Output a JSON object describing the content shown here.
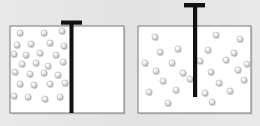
{
  "figure": {
    "background_color": "#e6e6e6",
    "width": 260,
    "height": 126
  },
  "style": {
    "container_fill": "#ffffff",
    "container_border": "#8a8a8a",
    "container_border_width": 1.2,
    "piston_color": "#111111",
    "particle_fill": "#d9d9d9",
    "particle_edge": "#9a9a9a",
    "particle_highlight": "#ffffff",
    "particle_radius": 3.1,
    "shadow_color": "#b8b8b8"
  },
  "panels": [
    {
      "id": "left-panel",
      "name": "compressed-gas-cylinder",
      "label": "",
      "container": {
        "x": 10,
        "y": 26,
        "width": 114,
        "height": 87
      },
      "piston": {
        "name": "piston-compressed",
        "state": "lowered",
        "stem": {
          "x": 69.5,
          "y": 24,
          "width": 4.0,
          "height": 89
        },
        "cap": {
          "x": 61,
          "y": 20.5,
          "width": 21,
          "height": 4.2
        },
        "handle_top_y": 20.5,
        "stem_bottom_y": 113
      },
      "gas_region": {
        "x": 11,
        "y": 27,
        "width": 58,
        "height": 85
      },
      "particle_count": 27,
      "particles": [
        [
          20,
          33
        ],
        [
          44,
          33
        ],
        [
          62,
          31
        ],
        [
          17,
          45
        ],
        [
          31,
          44
        ],
        [
          50,
          43
        ],
        [
          64,
          46
        ],
        [
          14,
          54
        ],
        [
          26,
          55
        ],
        [
          40,
          53
        ],
        [
          56,
          55
        ],
        [
          22,
          64
        ],
        [
          36,
          63
        ],
        [
          48,
          66
        ],
        [
          63,
          62
        ],
        [
          15,
          72
        ],
        [
          30,
          74
        ],
        [
          44,
          73
        ],
        [
          58,
          75
        ],
        [
          20,
          84
        ],
        [
          34,
          85
        ],
        [
          50,
          84
        ],
        [
          65,
          83
        ],
        [
          14,
          96
        ],
        [
          28,
          97
        ],
        [
          45,
          99
        ],
        [
          60,
          97
        ]
      ]
    },
    {
      "id": "right-panel",
      "name": "expanded-gas-cylinder",
      "label": "",
      "container": {
        "x": 138,
        "y": 26,
        "width": 113,
        "height": 87
      },
      "piston": {
        "name": "piston-raised",
        "state": "raised",
        "stem": {
          "x": 193,
          "y": 6,
          "width": 4.2,
          "height": 91
        },
        "cap": {
          "x": 184,
          "y": 3,
          "width": 21,
          "height": 4.4
        },
        "handle_top_y": 3,
        "stem_bottom_y": 97
      },
      "gas_region": {
        "x": 139,
        "y": 27,
        "width": 111,
        "height": 85
      },
      "particle_count": 26,
      "particles": [
        [
          155,
          37
        ],
        [
          216,
          35
        ],
        [
          240,
          39
        ],
        [
          160,
          52
        ],
        [
          178,
          49
        ],
        [
          208,
          50
        ],
        [
          234,
          53
        ],
        [
          145,
          63
        ],
        [
          172,
          63
        ],
        [
          200,
          61
        ],
        [
          226,
          60
        ],
        [
          247,
          64
        ],
        [
          156,
          71
        ],
        [
          183,
          73
        ],
        [
          211,
          72
        ],
        [
          238,
          70
        ],
        [
          163,
          81
        ],
        [
          190,
          79
        ],
        [
          219,
          83
        ],
        [
          244,
          80
        ],
        [
          149,
          92
        ],
        [
          176,
          90
        ],
        [
          205,
          93
        ],
        [
          230,
          91
        ],
        [
          168,
          103
        ],
        [
          212,
          102
        ]
      ]
    }
  ]
}
